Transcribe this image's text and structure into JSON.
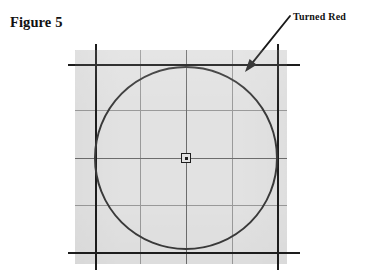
{
  "figure": {
    "caption": "Figure 5",
    "annotation_label": "Turned Red",
    "background_color": "#ffffff",
    "panel_color": "#e2e2e2",
    "ink_color": "#262626",
    "minor_grid_color": "#9a9a9a",
    "mid_grid_color": "#6d6d6d"
  },
  "chart_data": {
    "type": "scatter",
    "title": "Figure 5",
    "xlabel": "",
    "ylabel": "",
    "grid": true,
    "legend_position": "none",
    "panel": {
      "x": 75,
      "y": 50,
      "width": 212,
      "height": 214
    },
    "xlim": [
      95,
      277
    ],
    "ylim": [
      64,
      252
    ],
    "annotations": [
      {
        "text": "Turned Red",
        "text_x": 293,
        "text_y": 18,
        "arrow_from_x": 290,
        "arrow_from_y": 16,
        "arrow_to_x": 245,
        "arrow_to_y": 72
      }
    ],
    "shapes": [
      {
        "name": "circle",
        "type": "circle",
        "center_x": 186,
        "center_y": 158,
        "radius": 91,
        "stroke": "#3a3a3a",
        "stroke_width": 2,
        "fill": "none"
      },
      {
        "name": "center-marker",
        "type": "square-with-dot",
        "center_x": 186,
        "center_y": 158,
        "size": 9
      }
    ],
    "major_gridlines": {
      "vertical_x": [
        95,
        277
      ],
      "horizontal_y": [
        64,
        252
      ]
    },
    "mid_gridlines": {
      "vertical_x": [
        186
      ],
      "horizontal_y": [
        158
      ]
    },
    "minor_gridlines": {
      "vertical_x": [
        140,
        232
      ],
      "horizontal_y": [
        110,
        205
      ]
    }
  }
}
